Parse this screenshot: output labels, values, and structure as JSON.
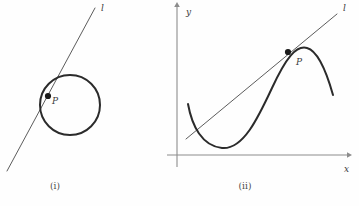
{
  "figure": {
    "background_color": "#fefefe",
    "stroke_color": "#2b2b2b",
    "axis_color": "#8c8c8c",
    "line_color": "#4a4a4a",
    "panels": [
      {
        "id": "panel-i",
        "caption": "(i)",
        "caption_x": 55,
        "caption_y": 189,
        "description": "tangent line touching a circle at point P",
        "tangent_label": "l",
        "tangent_label_x": 101,
        "tangent_label_y": 11,
        "point_label": "P",
        "point_label_x": 52,
        "point_label_y": 104,
        "point_x": 48,
        "point_y": 96,
        "circle_cx": 70,
        "circle_cy": 105,
        "circle_r": 30,
        "tangent_x1": 7,
        "tangent_y1": 171,
        "tangent_x2": 95,
        "tangent_y2": 8
      },
      {
        "id": "panel-ii",
        "caption": "(ii)",
        "caption_x": 245,
        "caption_y": 189,
        "description": "tangent line touching a cubic curve at point P on x-y axes",
        "tangent_label": "l",
        "tangent_label_x": 343,
        "tangent_label_y": 11,
        "point_label": "P",
        "point_label_x": 296,
        "point_label_y": 65,
        "point_x": 288,
        "point_y": 52,
        "x_axis_label": "x",
        "x_axis_label_x": 344,
        "x_axis_label_y": 172,
        "y_axis_label": "y",
        "y_axis_label_x": 186,
        "y_axis_label_y": 15,
        "x_axis_y": 155,
        "y_axis_x": 177,
        "x_axis_end": 347,
        "y_axis_top": 7,
        "tangent_x1": 186,
        "tangent_y1": 139,
        "tangent_x2": 337,
        "tangent_y2": 14,
        "curve_path": "M 188 104 C 192 126, 202 146, 222 148 C 243 150, 258 118, 272 88 C 286 58, 296 45, 307 48 C 318 51, 326 70, 333 95"
      }
    ]
  },
  "chart_data": {
    "type": "line",
    "title": "",
    "xlabel": "x",
    "ylabel": "y",
    "annotations": [
      "l",
      "P",
      "(i)",
      "(ii)"
    ],
    "series": [
      {
        "name": "circle",
        "panel": "(i)",
        "center": [
          70,
          105
        ],
        "radius": 30
      },
      {
        "name": "tangent-line-circle",
        "panel": "(i)",
        "x": [
          7,
          95
        ],
        "y": [
          171,
          8
        ]
      },
      {
        "name": "cubic-curve",
        "panel": "(ii)",
        "x": [
          188,
          222,
          272,
          307,
          333
        ],
        "y": [
          104,
          148,
          88,
          48,
          95
        ]
      },
      {
        "name": "tangent-line-curve",
        "panel": "(ii)",
        "x": [
          186,
          337
        ],
        "y": [
          139,
          14
        ]
      }
    ],
    "grid": false,
    "legend": "none"
  }
}
